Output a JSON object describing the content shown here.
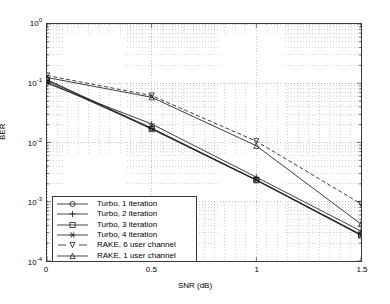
{
  "chart_data": {
    "type": "line",
    "title": "",
    "xlabel": "SNR (dB)",
    "ylabel": "BER",
    "xlim": [
      0,
      1.5
    ],
    "ylim": [
      0.0001,
      1
    ],
    "yscale": "log",
    "xticks": [
      "0",
      "0.5",
      "1",
      "1.5"
    ],
    "xtickvalues": [
      0,
      0.5,
      1,
      1.5
    ],
    "ytickvalues": [
      1,
      0.1,
      0.01,
      0.001,
      0.0001
    ],
    "yticks": [
      "10",
      "10",
      "10",
      "10",
      "10"
    ],
    "ytick_exponents": [
      "0",
      "-1",
      "-2",
      "-3",
      "-4"
    ],
    "grid": true,
    "grid_style": "dotted",
    "legend_position": "lower left",
    "x": [
      0,
      0.5,
      1,
      1.5
    ],
    "series": [
      {
        "name": "Turbo, 1 iteration",
        "label": "Turbo, 1 iteration",
        "marker": "circle",
        "linestyle": "solid",
        "color": "#1a1a1a",
        "values": [
          0.115,
          0.0175,
          0.00235,
          0.00028
        ]
      },
      {
        "name": "Turbo, 2 iteration",
        "label": "Turbo, 2 iteration",
        "marker": "plus",
        "linestyle": "solid",
        "color": "#1a1a1a",
        "values": [
          0.1,
          0.0205,
          0.0026,
          0.00032
        ]
      },
      {
        "name": "Turbo, 3 iteration",
        "label": "Turbo, 3 iteration",
        "marker": "square",
        "linestyle": "solid",
        "color": "#1a1a1a",
        "values": [
          0.112,
          0.0168,
          0.0023,
          0.00027
        ]
      },
      {
        "name": "Turbo, 4 iteration",
        "label": "Turbo, 4 iteration",
        "marker": "star",
        "linestyle": "solid",
        "color": "#1a1a1a",
        "values": [
          0.105,
          0.0172,
          0.00232,
          0.000275
        ]
      },
      {
        "name": "RAKE, 6 user channel",
        "label": "RAKE, 6 user channel",
        "marker": "triangle-down",
        "linestyle": "dashed",
        "color": "#1a1a1a",
        "values": [
          0.135,
          0.062,
          0.0105,
          0.00092
        ]
      },
      {
        "name": "RAKE, 1 user channel",
        "label": "RAKE, 1 user channel",
        "marker": "triangle-up",
        "linestyle": "solid",
        "color": "#1a1a1a",
        "values": [
          0.125,
          0.058,
          0.0088,
          0.00042
        ]
      }
    ]
  },
  "axes": {
    "ylabel": "BER",
    "xlabel": "SNR (dB)"
  }
}
